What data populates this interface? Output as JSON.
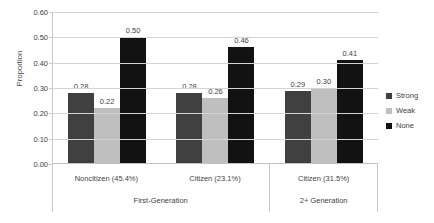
{
  "chart_data": {
    "type": "bar",
    "title": "",
    "xlabel": "",
    "ylabel": "Proportion",
    "ylim": [
      0.0,
      0.6
    ],
    "grid": true,
    "legend_position": "right",
    "categories": [
      "Noncitizen (45.4%)",
      "Citizen (23.1%)",
      "Citizen (31.5%)"
    ],
    "series": [
      {
        "name": "Strong",
        "color": "#404040",
        "values": [
          0.28,
          0.28,
          0.29
        ],
        "labels": [
          "0.28",
          "0.28",
          "0.29"
        ]
      },
      {
        "name": "Weak",
        "color": "#bfbfbf",
        "values": [
          0.22,
          0.26,
          0.3
        ],
        "labels": [
          "0.22",
          "0.26",
          "0.30"
        ]
      },
      {
        "name": "None",
        "color": "#121212",
        "values": [
          0.5,
          0.46,
          0.41
        ],
        "labels": [
          "0.50",
          "0.46",
          "0.41"
        ]
      }
    ],
    "y_ticks": [
      "0.60",
      "0.50",
      "0.40",
      "0.30",
      "0.20",
      "0.10",
      "0.00"
    ],
    "y_tick_values": [
      0.6,
      0.5,
      0.4,
      0.3,
      0.2,
      0.1,
      0.0
    ],
    "group_bands": [
      {
        "label": "First-Generation",
        "span": [
          0,
          1
        ]
      },
      {
        "label": "2+ Generation",
        "span": [
          2,
          2
        ]
      }
    ]
  },
  "legend": {
    "items": [
      {
        "label": "Strong",
        "color": "#404040"
      },
      {
        "label": "Weak",
        "color": "#bfbfbf"
      },
      {
        "label": "None",
        "color": "#121212"
      }
    ]
  },
  "axes": {
    "y_title": "Proportion"
  }
}
